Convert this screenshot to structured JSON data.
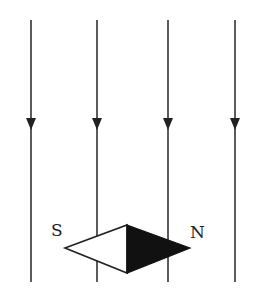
{
  "diagram": {
    "field_lines": [
      {
        "x": 31,
        "y1": 20,
        "y2": 282,
        "direction": "down",
        "arrow_y": 124
      },
      {
        "x": 97,
        "y1": 20,
        "y2": 282,
        "direction": "down",
        "arrow_y": 124
      },
      {
        "x": 168,
        "y1": 20,
        "y2": 282,
        "direction": "down",
        "arrow_y": 124
      },
      {
        "x": 235,
        "y1": 20,
        "y2": 282,
        "direction": "down",
        "arrow_y": 124
      }
    ],
    "needle": {
      "south_label": "S",
      "north_label": "N",
      "south_half": "white",
      "north_half": "black"
    },
    "colors": {
      "line": "#333333",
      "needle_north": "#111111",
      "needle_south": "#ffffff",
      "background": "#ffffff"
    }
  }
}
